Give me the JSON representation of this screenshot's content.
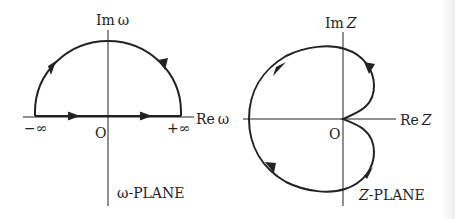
{
  "figure": {
    "panels": [
      {
        "id": "omega-plane",
        "plane_label": "ω-PLANE",
        "axes": {
          "imag_label": "Im ω",
          "real_label": "Re ω",
          "origin_label": "O"
        },
        "markers": {
          "neg_inf": "−∞",
          "pos_inf": "+∞"
        },
        "contour": "semicircle in upper half plane, traversed along real axis from −∞ to +∞ then back over arc (counterclockwise)"
      },
      {
        "id": "z-plane",
        "plane_label": "Z-PLANE",
        "axes": {
          "imag_label": "Im Z",
          "real_label": "Re Z",
          "origin_label": "O"
        },
        "contour": "cardioid-like closed curve with cusp at origin, mapped image of ω contour"
      }
    ],
    "colors": {
      "line": "#222222",
      "background": "#ffffff"
    }
  },
  "labels": {
    "im_omega_prefix": "Im",
    "omega": "ω",
    "re_omega_prefix": "Re",
    "neg_inf": "−∞",
    "pos_inf": "+∞",
    "origin_left": "O",
    "omega_plane": "ω-PLANE",
    "im_z_prefix": "Im",
    "z": "Z",
    "re_z_prefix": "Re",
    "origin_right": "O",
    "z_plane_prefix": "Z",
    "z_plane_suffix": "-PLANE"
  }
}
